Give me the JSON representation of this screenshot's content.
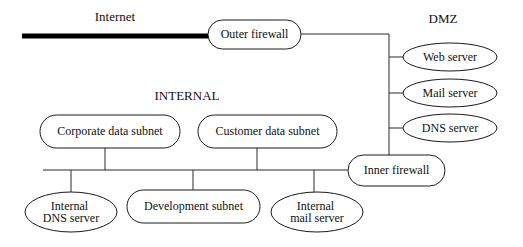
{
  "diagram": {
    "canvas": {
      "width": 523,
      "height": 247,
      "background": "#ffffff"
    },
    "style": {
      "line_color": "#2b2b2b",
      "shape_stroke": "#1a1a1a",
      "shape_fill": "#ffffff",
      "text_color": "#111111",
      "trunk_color": "#000000"
    },
    "zone_labels": [
      {
        "id": "internet",
        "text": "Internet",
        "x": 115,
        "y": 18,
        "font_size": 13
      },
      {
        "id": "dmz",
        "text": "DMZ",
        "x": 443,
        "y": 20,
        "font_size": 13
      },
      {
        "id": "internal",
        "text": "INTERNAL",
        "x": 187,
        "y": 97,
        "font_size": 13
      }
    ],
    "nodes": [
      {
        "id": "outer-firewall",
        "label": "Outer firewall",
        "shape": "rounded-rect",
        "x": 208,
        "y": 20,
        "width": 93,
        "height": 29,
        "rx": 14.5,
        "font_size": 12
      },
      {
        "id": "web-server",
        "label": "Web server",
        "shape": "ellipse",
        "cx": 450,
        "cy": 57,
        "rx": 47,
        "ry": 14,
        "font_size": 12
      },
      {
        "id": "mail-server",
        "label": "Mail server",
        "shape": "ellipse",
        "cx": 450,
        "cy": 93,
        "rx": 47,
        "ry": 14,
        "font_size": 12
      },
      {
        "id": "dns-server",
        "label": "DNS server",
        "shape": "ellipse",
        "cx": 450,
        "cy": 128,
        "rx": 47,
        "ry": 14,
        "font_size": 12
      },
      {
        "id": "inner-firewall",
        "label": "Inner firewall",
        "shape": "rounded-rect",
        "x": 348,
        "y": 155,
        "width": 97,
        "height": 31,
        "rx": 15.5,
        "font_size": 12
      },
      {
        "id": "corporate-data-subnet",
        "label": "Corporate data subnet",
        "shape": "rounded-rect",
        "x": 40,
        "y": 115,
        "width": 140,
        "height": 33,
        "rx": 16.5,
        "font_size": 12
      },
      {
        "id": "customer-data-subnet",
        "label": "Customer data subnet",
        "shape": "rounded-rect",
        "x": 198,
        "y": 115,
        "width": 139,
        "height": 33,
        "rx": 16.5,
        "font_size": 12
      },
      {
        "id": "internal-dns-server",
        "label": "Internal DNS server",
        "label_lines": [
          "Internal",
          "DNS server"
        ],
        "shape": "ellipse",
        "cx": 71,
        "cy": 212,
        "rx": 46,
        "ry": 20,
        "font_size": 12
      },
      {
        "id": "development-subnet",
        "label": "Development subnet",
        "shape": "rounded-rect",
        "x": 127,
        "y": 190,
        "width": 133,
        "height": 33,
        "rx": 16.5,
        "font_size": 12
      },
      {
        "id": "internal-mail-server",
        "label": "Internal mail server",
        "label_lines": [
          "Internal",
          "mail server"
        ],
        "shape": "ellipse",
        "cx": 317,
        "cy": 212,
        "rx": 46,
        "ry": 20,
        "font_size": 12
      }
    ],
    "connections": [
      {
        "id": "internet-trunk",
        "from": "internet",
        "to": "outer-firewall",
        "type": "thick-bus",
        "path": "M22,36 L208,36"
      },
      {
        "id": "outer-to-dmz-bus",
        "from": "outer-firewall",
        "to": "dmz-bus",
        "type": "line",
        "path": "M301,34 L389,34"
      },
      {
        "id": "dmz-vertical-bus",
        "from": "dmz-bus-top",
        "to": "inner-firewall",
        "type": "line",
        "path": "M389,34 L389,156"
      },
      {
        "id": "dmz-to-web",
        "from": "dmz-bus",
        "to": "web-server",
        "type": "line",
        "path": "M389,57 L403,57"
      },
      {
        "id": "dmz-to-mail",
        "from": "dmz-bus",
        "to": "mail-server",
        "type": "line",
        "path": "M389,93 L403,93"
      },
      {
        "id": "dmz-to-dns",
        "from": "dmz-bus",
        "to": "dns-server",
        "type": "line",
        "path": "M389,128 L403,128"
      },
      {
        "id": "internal-bus",
        "from": "internal-bus-left",
        "to": "inner-firewall",
        "type": "line",
        "path": "M43,170 L349,170"
      },
      {
        "id": "corporate-to-bus",
        "from": "corporate-data-subnet",
        "to": "internal-bus",
        "type": "line",
        "path": "M105,148 L105,170"
      },
      {
        "id": "customer-to-bus",
        "from": "customer-data-subnet",
        "to": "internal-bus",
        "type": "line",
        "path": "M257,148 L257,170"
      },
      {
        "id": "bus-to-internal-dns",
        "from": "internal-bus",
        "to": "internal-dns-server",
        "type": "line",
        "path": "M71,170 L71,195"
      },
      {
        "id": "bus-to-development",
        "from": "internal-bus",
        "to": "development-subnet",
        "type": "line",
        "path": "M193,170 L193,190"
      },
      {
        "id": "bus-to-internal-mail",
        "from": "internal-bus",
        "to": "internal-mail-server",
        "type": "line",
        "path": "M314,170 L314,195"
      }
    ]
  }
}
